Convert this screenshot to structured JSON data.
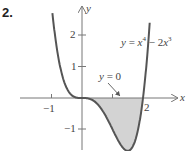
{
  "problem_number": "2.",
  "equation": {
    "lhs": "y",
    "eq": " = ",
    "t1": "x",
    "e1": "4",
    "op": " − 2",
    "t2": "x",
    "e2": "3"
  },
  "annotation": {
    "var": "y",
    "text": " = 0"
  },
  "axes": {
    "x_label": "x",
    "y_label": "y"
  },
  "ticks": {
    "x": [
      {
        "value": -1,
        "label": "−1"
      },
      {
        "value": 1,
        "label": ""
      },
      {
        "value": 2,
        "label": "2"
      }
    ],
    "y": [
      {
        "value": 2,
        "label": "2"
      },
      {
        "value": 1,
        "label": "1"
      },
      {
        "value": -1,
        "label": "−1"
      }
    ]
  },
  "colors": {
    "curve": "#555555",
    "fill": "#d3d3d3",
    "axis": "#777777"
  },
  "chart_data": {
    "type": "line",
    "title": "",
    "function": "y = x^4 - 2x^3",
    "xlabel": "x",
    "ylabel": "y",
    "xlim": [
      -1.2,
      3
    ],
    "ylim": [
      -1.7,
      2.8
    ],
    "x_ticks": [
      -1,
      1,
      2
    ],
    "y_ticks": [
      -1,
      1,
      2
    ],
    "shaded_region": {
      "between": [
        "y = x^4 - 2x^3",
        "y = 0"
      ],
      "x_range": [
        0,
        2
      ]
    },
    "key_points": [
      {
        "x": 0,
        "y": 0
      },
      {
        "x": 2,
        "y": 0
      },
      {
        "x": 1.5,
        "y": -1.6875
      }
    ],
    "annotations": [
      "y = x^4 - 2x^3",
      "y = 0"
    ],
    "grid": false
  }
}
